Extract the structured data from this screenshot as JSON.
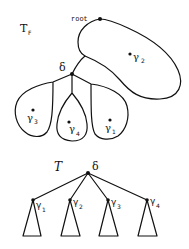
{
  "top_figure": {
    "title": "T",
    "title_sub": "F",
    "root_label": "root",
    "delta_label": "δ",
    "big_lobe": {
      "label": "γ",
      "sub": "2"
    },
    "lobes": [
      {
        "label": "γ",
        "sub": "3"
      },
      {
        "label": "γ",
        "sub": "4"
      },
      {
        "label": "γ",
        "sub": "1"
      }
    ]
  },
  "bottom_figure": {
    "title": "T",
    "root_label": "δ",
    "children": [
      {
        "label": "γ",
        "sub": "1"
      },
      {
        "label": "γ",
        "sub": "2"
      },
      {
        "label": "γ",
        "sub": "3"
      },
      {
        "label": "γ",
        "sub": "4"
      }
    ]
  }
}
